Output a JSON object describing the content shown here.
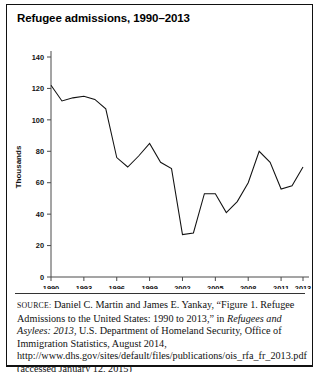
{
  "figure": {
    "title": "Refugee admissions, 1990–2013"
  },
  "source": {
    "label": "SOURCE:",
    "text_part1": " Daniel C. Martin and James E. Yankay, “Figure 1. Refugee Admissions to the United States: 1990 to 2013,” in ",
    "italic1": "Refugees and Asylees: 2013",
    "text_part2": ", U.S. Department of Homeland Security, Office of Immigration Statistics, August 2014, http://www.dhs.gov/sites/default/files/publications/ois_rfa_fr_2013.pdf (accessed January 12, 2015)"
  },
  "chart_data": {
    "type": "line",
    "title": "Refugee admissions, 1990–2013",
    "xlabel": "",
    "ylabel": "Thousands",
    "xlim": [
      1990,
      2013
    ],
    "ylim": [
      0,
      140
    ],
    "grid": false,
    "legend": "none",
    "y_ticks": [
      0,
      20,
      40,
      60,
      80,
      100,
      120,
      140
    ],
    "x_ticks": [
      1990,
      1993,
      1996,
      1999,
      2002,
      2005,
      2008,
      2011,
      2013
    ],
    "x_tick_labels": [
      "1990",
      "1993",
      "1996",
      "1999",
      "2002",
      "2005",
      "2008",
      "2011",
      "2013"
    ],
    "y_tick_labels": [
      "0",
      "20",
      "40",
      "60",
      "80",
      "100",
      "120",
      "140"
    ],
    "x": [
      1990,
      1991,
      1992,
      1993,
      1994,
      1995,
      1996,
      1997,
      1998,
      1999,
      2000,
      2001,
      2002,
      2003,
      2004,
      2005,
      2006,
      2007,
      2008,
      2009,
      2010,
      2011,
      2012,
      2013
    ],
    "values": [
      122,
      112,
      114,
      115,
      113,
      107,
      76,
      70,
      77,
      85,
      73,
      69,
      27,
      28,
      53,
      53,
      41,
      48,
      60,
      80,
      73,
      56,
      58,
      70
    ],
    "series": [
      {
        "name": "Refugee admissions",
        "values": [
          122,
          112,
          114,
          115,
          113,
          107,
          76,
          70,
          77,
          85,
          73,
          69,
          27,
          28,
          53,
          53,
          41,
          48,
          60,
          80,
          73,
          56,
          58,
          70
        ]
      }
    ]
  }
}
